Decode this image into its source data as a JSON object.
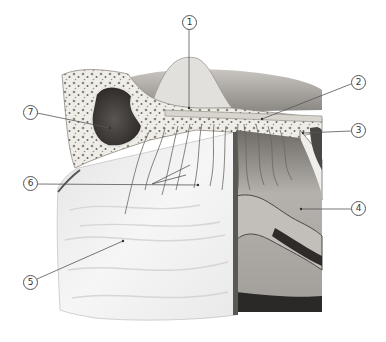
{
  "figure": {
    "type": "anatomical illustration",
    "style": "grayscale pencil rendering",
    "colors": {
      "background": "#ffffff",
      "bone_light": "#f2f0ec",
      "bone_pores": "#7a756c",
      "sinus_dark": "#3a3633",
      "mucosa_light": "#ececec",
      "tissue_mid": "#a9a6a1",
      "tissue_dark": "#2c2a28",
      "leader_line": "#555555"
    }
  },
  "callouts": [
    {
      "number": "1",
      "label": "①",
      "circle": [
        189,
        22
      ],
      "target": [
        189,
        108
      ]
    },
    {
      "number": "2",
      "label": "②",
      "circle": [
        358,
        82
      ],
      "target": [
        262,
        119
      ]
    },
    {
      "number": "3",
      "label": "③",
      "circle": [
        358,
        130
      ],
      "target": [
        303,
        133
      ]
    },
    {
      "number": "4",
      "label": "④",
      "circle": [
        358,
        208
      ],
      "target": [
        301,
        209
      ]
    },
    {
      "number": "5",
      "label": "⑤",
      "circle": [
        30,
        282
      ],
      "target": [
        123,
        241
      ]
    },
    {
      "number": "6",
      "label": "⑥",
      "circle": [
        30,
        183
      ],
      "target": [
        198,
        185
      ]
    },
    {
      "number": "7",
      "label": "⑦",
      "circle": [
        30,
        112
      ],
      "target": [
        110,
        128
      ]
    }
  ]
}
